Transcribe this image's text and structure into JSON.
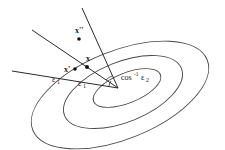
{
  "diagram": {
    "labels": {
      "x_double_prime": "x''",
      "x_prime": "x'",
      "x": "x",
      "epsilon1_outer": "ε",
      "epsilon1_outer_sub": "1",
      "epsilon1_inner": "ε",
      "epsilon1_inner_sub": "1",
      "angle_label_cos": "cos",
      "angle_label_sup": "-1",
      "angle_label_eps": "ε",
      "angle_label_sub": "2"
    },
    "colors": {
      "stroke": "#2a2a2a",
      "ellipse": "#444444",
      "text": "#1a1a1a",
      "background": "#ffffff"
    },
    "points": [
      {
        "name": "x''",
        "cx": 79,
        "cy": 39
      },
      {
        "name": "x'",
        "cx": 75,
        "cy": 69
      },
      {
        "name": "x",
        "cx": 87,
        "cy": 67
      }
    ],
    "vertex": {
      "cx": 118,
      "cy": 88
    }
  }
}
